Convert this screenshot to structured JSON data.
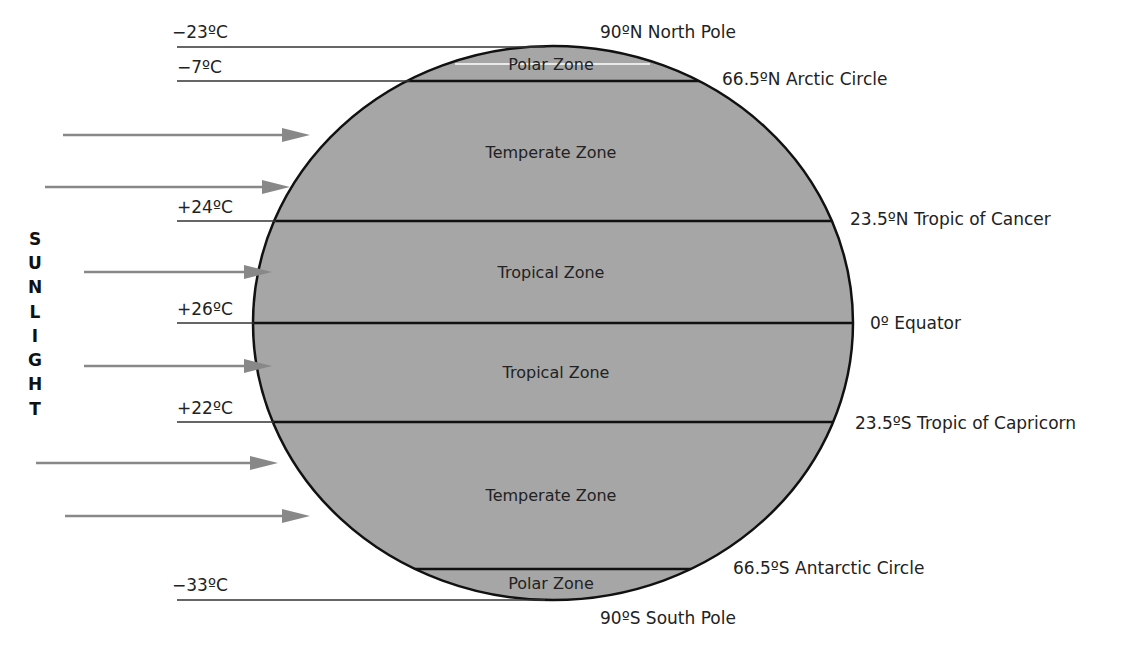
{
  "title_vertical": "SUNLIGHT",
  "sunlight_letters": [
    "S",
    "U",
    "N",
    "L",
    "I",
    "G",
    "H",
    "T"
  ],
  "colors": {
    "earth_fill": "#a6a6a6",
    "outline": "#111111",
    "arrow": "#888888",
    "text": "#222222"
  },
  "latitudes": [
    {
      "label": "90ºN North Pole"
    },
    {
      "label": "66.5ºN Arctic Circle"
    },
    {
      "label": "23.5ºN Tropic of Cancer"
    },
    {
      "label": "0º Equator"
    },
    {
      "label": "23.5ºS Tropic of Capricorn"
    },
    {
      "label": "66.5ºS Antarctic Circle"
    },
    {
      "label": "90ºS South Pole"
    }
  ],
  "temperatures": [
    {
      "label": "−23ºC"
    },
    {
      "label": "−7ºC"
    },
    {
      "label": "+24ºC"
    },
    {
      "label": "+26ºC"
    },
    {
      "label": "+22ºC"
    },
    {
      "label": "−33ºC"
    }
  ],
  "zones": [
    {
      "label": "Polar Zone"
    },
    {
      "label": "Temperate Zone"
    },
    {
      "label": "Tropical Zone"
    },
    {
      "label": "Tropical Zone"
    },
    {
      "label": "Temperate Zone"
    },
    {
      "label": "Polar Zone"
    }
  ],
  "arrows_count": 6
}
